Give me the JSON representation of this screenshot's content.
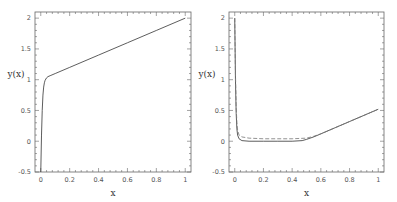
{
  "chart_data": [
    {
      "type": "line",
      "title": "",
      "xlabel": "x",
      "ylabel": "y(x)",
      "xlim": [
        -0.04,
        1.04
      ],
      "ylim": [
        -0.5,
        2.1
      ],
      "xticks": [
        "0",
        "0.2",
        "0.4",
        "0.6",
        "0.8",
        "1"
      ],
      "yticks": [
        "-0.5",
        "0",
        "0.5",
        "1",
        "1.5",
        "2"
      ],
      "grid": false,
      "legend": null,
      "series": [
        {
          "name": "solution",
          "style": "solid",
          "x": [
            0.0,
            0.005,
            0.01,
            0.015,
            0.02,
            0.025,
            0.03,
            0.04,
            0.05,
            0.07,
            0.1,
            0.2,
            0.4,
            0.6,
            0.8,
            1.0
          ],
          "y": [
            -0.5,
            0.1,
            0.5,
            0.75,
            0.88,
            0.95,
            0.99,
            1.03,
            1.05,
            1.07,
            1.1,
            1.2,
            1.4,
            1.6,
            1.8,
            2.0
          ]
        }
      ]
    },
    {
      "type": "line",
      "title": "",
      "xlabel": "x",
      "ylabel": "y(x)",
      "xlim": [
        -0.04,
        1.04
      ],
      "ylim": [
        -0.5,
        2.1
      ],
      "xticks": [
        "0",
        "0.2",
        "0.4",
        "0.6",
        "0.8",
        "1"
      ],
      "yticks": [
        "-0.5",
        "0",
        "0.5",
        "1",
        "1.5",
        "2"
      ],
      "grid": false,
      "legend": null,
      "series": [
        {
          "name": "solid",
          "style": "solid",
          "x": [
            0.0,
            0.005,
            0.01,
            0.015,
            0.02,
            0.03,
            0.05,
            0.1,
            0.2,
            0.3,
            0.4,
            0.47,
            0.5,
            0.55,
            0.6,
            0.7,
            0.8,
            0.9,
            1.0
          ],
          "y": [
            2.0,
            1.0,
            0.45,
            0.2,
            0.1,
            0.04,
            0.01,
            0.0,
            0.0,
            0.0,
            0.0,
            0.01,
            0.03,
            0.07,
            0.12,
            0.22,
            0.32,
            0.42,
            0.52
          ]
        },
        {
          "name": "dashed",
          "style": "dashed",
          "x": [
            0.0,
            0.005,
            0.01,
            0.015,
            0.02,
            0.03,
            0.05,
            0.1,
            0.2,
            0.3,
            0.4,
            0.5,
            0.55,
            0.6,
            0.7,
            0.8,
            0.9,
            1.0
          ],
          "y": [
            2.0,
            1.1,
            0.55,
            0.3,
            0.18,
            0.1,
            0.07,
            0.05,
            0.04,
            0.04,
            0.04,
            0.05,
            0.08,
            0.12,
            0.22,
            0.32,
            0.42,
            0.52
          ]
        }
      ]
    }
  ]
}
